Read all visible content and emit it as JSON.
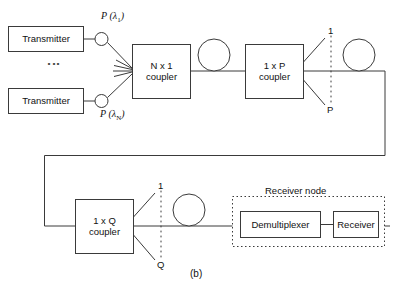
{
  "figure": {
    "caption": "(b)",
    "kind": "optical WDM broadcast-and-select network diagram"
  },
  "transmitters": [
    {
      "label": "Transmitter",
      "power_label": "P",
      "wavelength": "λ",
      "wavelength_index": "1"
    },
    {
      "label": "Transmitter",
      "power_label": "P",
      "wavelength": "λ",
      "wavelength_index": "N"
    }
  ],
  "vertical_ellipsis": "⋮",
  "couplers": [
    {
      "name": "n-x-1-coupler",
      "line1": "N x 1",
      "line2": "coupler"
    },
    {
      "name": "1-x-p-coupler",
      "line1": "1 x P",
      "line2": "coupler",
      "out_first": "1",
      "out_last": "P"
    },
    {
      "name": "1-x-q-coupler",
      "line1": "1 x Q",
      "line2": "coupler",
      "out_first": "1",
      "out_last": "Q"
    }
  ],
  "amplifiers": [
    {
      "name": "amplifier-1"
    },
    {
      "name": "amplifier-2"
    },
    {
      "name": "amplifier-3"
    }
  ],
  "receiver_node": {
    "title": "Receiver node",
    "blocks": [
      {
        "label": "Demultiplexer"
      },
      {
        "label": "Receiver"
      }
    ]
  },
  "colors": {
    "stroke": "#3a3a3a",
    "text": "#111111",
    "background": "#ffffff"
  }
}
